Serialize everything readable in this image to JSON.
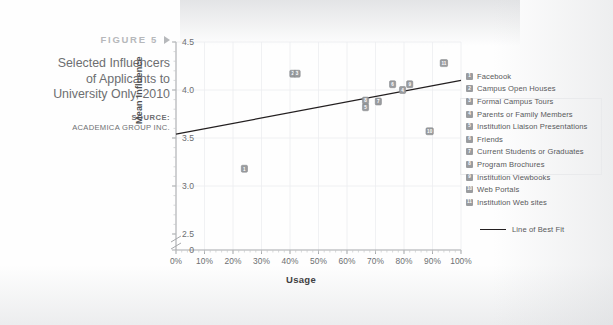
{
  "caption": {
    "figure_label": "FIGURE 5",
    "arrow_icon": "triangle-right-icon",
    "title": "Selected Influencers of Applicants to University Only, 2010",
    "title_lines": [
      "Selected Influencers",
      "of Applicants to",
      "University Only, 2010"
    ],
    "source_label": "SOURCE:",
    "source_name": "ACADEMICA GROUP INC."
  },
  "legend": {
    "items": [
      {
        "num": "1",
        "label": "Facebook"
      },
      {
        "num": "2",
        "label": "Campus Open Houses"
      },
      {
        "num": "3",
        "label": "Formal Campus Tours"
      },
      {
        "num": "4",
        "label": "Parents or Family Members"
      },
      {
        "num": "5",
        "label": "Institution Liaison Presentations"
      },
      {
        "num": "6",
        "label": "Friends"
      },
      {
        "num": "7",
        "label": "Current Students or Graduates"
      },
      {
        "num": "8",
        "label": "Program Brochures"
      },
      {
        "num": "9",
        "label": "Institution Viewbooks"
      },
      {
        "num": "10",
        "label": "Web Portals"
      },
      {
        "num": "11",
        "label": "Institution Web sites"
      }
    ],
    "fit_label": "Line of Best Fit"
  },
  "chart_data": {
    "type": "scatter",
    "title": "Selected Influencers of Applicants to University Only, 2010",
    "xlabel": "Usage",
    "ylabel": "Mean Influence",
    "xlim": [
      0,
      100
    ],
    "ylim": [
      2.5,
      4.5
    ],
    "y_axis_break": true,
    "y_zero_shown": true,
    "xticks": [
      "0%",
      "10%",
      "20%",
      "30%",
      "40%",
      "50%",
      "60%",
      "70%",
      "80%",
      "90%",
      "100%"
    ],
    "xtick_values": [
      0,
      10,
      20,
      30,
      40,
      50,
      60,
      70,
      80,
      90,
      100
    ],
    "yticks": [
      "0",
      "2.5",
      "3.0",
      "3.5",
      "4.0",
      "4.5"
    ],
    "ytick_values": [
      0,
      2.5,
      3.0,
      3.5,
      4.0,
      4.5
    ],
    "grid": true,
    "legend_position": "right",
    "points": [
      {
        "num": "1",
        "name": "Facebook",
        "x": 24.0,
        "y": 3.18
      },
      {
        "num": "2",
        "name": "Campus Open Houses",
        "x": 41.0,
        "y": 4.17
      },
      {
        "num": "3",
        "name": "Formal Campus Tours",
        "x": 42.5,
        "y": 4.17
      },
      {
        "num": "4",
        "name": "Parents or Family Members",
        "x": 79.5,
        "y": 4.0
      },
      {
        "num": "5",
        "name": "Institution Liaison Presentations",
        "x": 66.5,
        "y": 3.82
      },
      {
        "num": "6",
        "name": "Friends",
        "x": 76.0,
        "y": 4.06
      },
      {
        "num": "7",
        "name": "Current Students or Graduates",
        "x": 71.0,
        "y": 3.88
      },
      {
        "num": "8",
        "name": "Program Brochures",
        "x": 66.5,
        "y": 3.89
      },
      {
        "num": "9",
        "name": "Institution Viewbooks",
        "x": 82.0,
        "y": 4.06
      },
      {
        "num": "10",
        "name": "Web Portals",
        "x": 89.0,
        "y": 3.57
      },
      {
        "num": "11",
        "name": "Institution Web sites",
        "x": 94.0,
        "y": 4.28
      }
    ],
    "line_of_best_fit": {
      "x0": 0,
      "y0": 3.54,
      "x1": 100,
      "y1": 4.1
    }
  }
}
